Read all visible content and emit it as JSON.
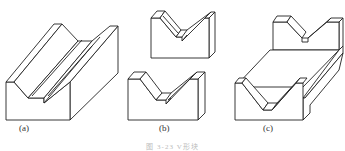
{
  "figure": {
    "caption": "图 3-23 V形块",
    "line_color": "#222222",
    "background": "#ffffff"
  },
  "panels": [
    {
      "id": "a",
      "label": "(a)",
      "description": "long V-block with continuous V-groove"
    },
    {
      "id": "b",
      "label": "(b)",
      "description": "two short V-blocks"
    },
    {
      "id": "c",
      "label": "(c)",
      "description": "double V-block connected by base plate"
    }
  ]
}
